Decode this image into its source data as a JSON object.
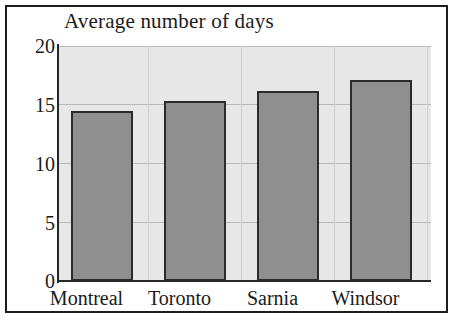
{
  "chart_data": {
    "type": "bar",
    "title": "Average number of days",
    "xlabel": "",
    "ylabel": "",
    "categories": [
      "Montreal",
      "Toronto",
      "Sarnia",
      "Windsor"
    ],
    "values": [
      14.5,
      15.3,
      16.2,
      17.1
    ],
    "ylim": [
      0,
      20
    ],
    "yticks": [
      "0",
      "5",
      "10",
      "15",
      "20"
    ],
    "ytick_values": [
      0,
      5,
      10,
      15,
      20
    ],
    "grid": true,
    "legend": "none",
    "colors": {
      "bar_fill": "#8f8f8f",
      "bar_edge": "#2b2b2b",
      "plot_background": "#e7e7e7",
      "frame": "#1d1d1d",
      "gridline": "#b9b9b9",
      "text": "#1b1b1b"
    }
  }
}
